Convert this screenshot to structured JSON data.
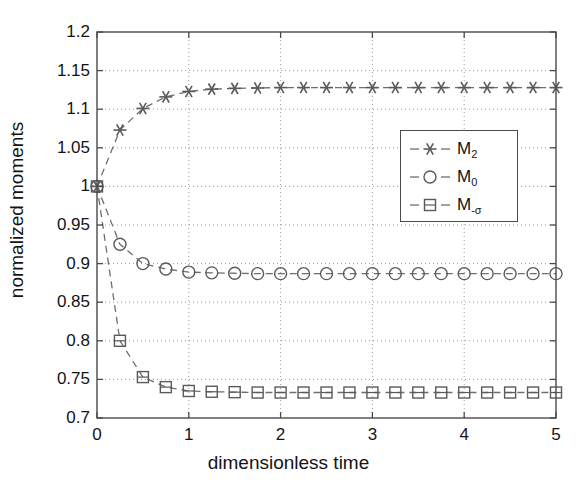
{
  "chart_data": {
    "type": "line",
    "title": "",
    "xlabel": "dimensionless time",
    "ylabel": "normalized moments",
    "xlim": [
      0,
      5
    ],
    "ylim": [
      0.7,
      1.2
    ],
    "xticks": [
      0,
      1,
      2,
      3,
      4,
      5
    ],
    "xtick_labels": [
      "0",
      "1",
      "2",
      "3",
      "4",
      "5"
    ],
    "yticks": [
      0.7,
      0.75,
      0.8,
      0.85,
      0.9,
      0.95,
      1.0,
      1.05,
      1.1,
      1.15,
      1.2
    ],
    "ytick_labels": [
      "0.7",
      "0.75",
      "0.8",
      "0.85",
      "0.9",
      "0.95",
      "1",
      "1.05",
      "1.1",
      "1.15",
      "1.2"
    ],
    "grid": true,
    "grid_style": "dotted",
    "legend_position": "center-right",
    "line_style": "dashed",
    "line_color": "#6e6e6e",
    "marker_color": "#5a5a5a",
    "axis_color": "#4a4a4a",
    "series": [
      {
        "name": "M_2",
        "label": "M",
        "sub": "2",
        "marker": "asterisk",
        "x": [
          0,
          0.25,
          0.5,
          0.75,
          1.0,
          1.25,
          1.5,
          1.75,
          2.0,
          2.25,
          2.5,
          2.75,
          3.0,
          3.25,
          3.5,
          3.75,
          4.0,
          4.25,
          4.5,
          4.75,
          5.0
        ],
        "y": [
          1.0,
          1.073,
          1.101,
          1.116,
          1.123,
          1.126,
          1.127,
          1.1275,
          1.128,
          1.128,
          1.128,
          1.128,
          1.128,
          1.128,
          1.128,
          1.128,
          1.128,
          1.128,
          1.128,
          1.128,
          1.128
        ]
      },
      {
        "name": "M_0",
        "label": "M",
        "sub": "0",
        "marker": "circle",
        "x": [
          0,
          0.25,
          0.5,
          0.75,
          1.0,
          1.25,
          1.5,
          1.75,
          2.0,
          2.25,
          2.5,
          2.75,
          3.0,
          3.25,
          3.5,
          3.75,
          4.0,
          4.25,
          4.5,
          4.75,
          5.0
        ],
        "y": [
          1.0,
          0.925,
          0.9,
          0.893,
          0.889,
          0.888,
          0.8875,
          0.887,
          0.887,
          0.887,
          0.887,
          0.887,
          0.887,
          0.887,
          0.887,
          0.887,
          0.887,
          0.887,
          0.887,
          0.887,
          0.887
        ]
      },
      {
        "name": "M_-sigma",
        "label": "M",
        "sub": "-σ",
        "marker": "square",
        "x": [
          0,
          0.25,
          0.5,
          0.75,
          1.0,
          1.25,
          1.5,
          1.75,
          2.0,
          2.25,
          2.5,
          2.75,
          3.0,
          3.25,
          3.5,
          3.75,
          4.0,
          4.25,
          4.5,
          4.75,
          5.0
        ],
        "y": [
          1.0,
          0.8,
          0.753,
          0.74,
          0.735,
          0.734,
          0.7335,
          0.733,
          0.733,
          0.733,
          0.733,
          0.733,
          0.733,
          0.733,
          0.733,
          0.733,
          0.733,
          0.733,
          0.733,
          0.733,
          0.733
        ]
      }
    ]
  },
  "legend": {
    "entries": [
      {
        "label": "M",
        "sub": "2",
        "marker": "asterisk"
      },
      {
        "label": "M",
        "sub": "0",
        "marker": "circle"
      },
      {
        "label": "M",
        "sub": "-σ",
        "marker": "square"
      }
    ]
  }
}
